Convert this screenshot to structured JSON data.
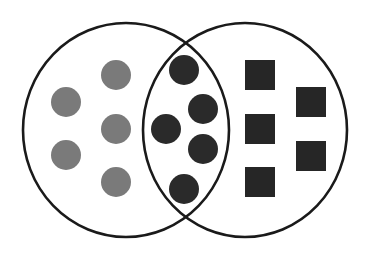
{
  "diagram": {
    "type": "venn",
    "sets": [
      {
        "name": "left-set",
        "cx": 126,
        "cy": 130,
        "rx": 103,
        "ry": 107
      },
      {
        "name": "right-set",
        "cx": 245,
        "cy": 130,
        "rx": 102,
        "ry": 107
      }
    ],
    "colors": {
      "outline": "#1a1a1a",
      "gray_circle": "#7a7a7a",
      "dark_circle": "#2a2a2a",
      "dark_square": "#262626"
    },
    "left_only_items": [
      {
        "shape": "circle",
        "cx": 66,
        "cy": 102,
        "r": 15
      },
      {
        "shape": "circle",
        "cx": 116,
        "cy": 75,
        "r": 15
      },
      {
        "shape": "circle",
        "cx": 116,
        "cy": 129,
        "r": 15
      },
      {
        "shape": "circle",
        "cx": 66,
        "cy": 155,
        "r": 15
      },
      {
        "shape": "circle",
        "cx": 116,
        "cy": 182,
        "r": 15
      }
    ],
    "intersection_items": [
      {
        "shape": "circle",
        "cx": 184,
        "cy": 70,
        "r": 15
      },
      {
        "shape": "circle",
        "cx": 203,
        "cy": 109,
        "r": 15
      },
      {
        "shape": "circle",
        "cx": 166,
        "cy": 129,
        "r": 15
      },
      {
        "shape": "circle",
        "cx": 203,
        "cy": 149,
        "r": 15
      },
      {
        "shape": "circle",
        "cx": 184,
        "cy": 189,
        "r": 15
      }
    ],
    "right_only_items": [
      {
        "shape": "square",
        "x": 245,
        "y": 60,
        "size": 30
      },
      {
        "shape": "square",
        "x": 296,
        "y": 87,
        "size": 30
      },
      {
        "shape": "square",
        "x": 245,
        "y": 114,
        "size": 30
      },
      {
        "shape": "square",
        "x": 296,
        "y": 141,
        "size": 30
      },
      {
        "shape": "square",
        "x": 245,
        "y": 167,
        "size": 30
      }
    ]
  }
}
